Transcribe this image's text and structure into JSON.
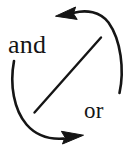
{
  "diagram": {
    "type": "cycle-diagram",
    "background_color": "#ffffff",
    "stroke_color": "#151515",
    "width": 132,
    "height": 150,
    "labels": {
      "and": "and",
      "or": "or"
    },
    "elements": [
      {
        "name": "top-arc-arrow",
        "description": "arc sweeping from right side up and over to the top-left, terminating in a left-pointing arrowhead",
        "arrowhead_direction": "left"
      },
      {
        "name": "bottom-arc-arrow",
        "description": "arc sweeping from left side down and around to the bottom-right, terminating in a right-pointing arrowhead",
        "arrowhead_direction": "right"
      },
      {
        "name": "diagonal-line",
        "description": "straight line crossing the circle from lower-left to upper-right"
      }
    ]
  }
}
